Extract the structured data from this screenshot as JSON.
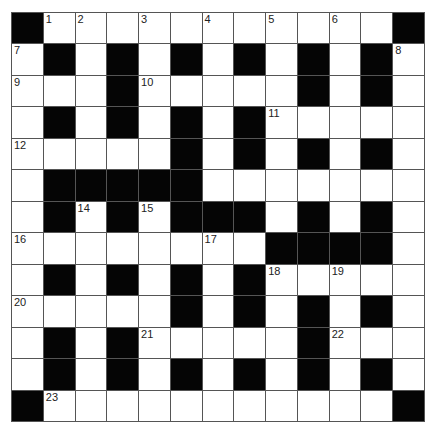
{
  "puzzle": {
    "rows": 13,
    "cols": 13,
    "layout": [
      "#...........#",
      ".#.#.#.#.#.#.",
      "...#.....#.#.",
      ".#.#.#.#.....",
      ".....#.#.#.#.",
      ".#####.......",
      ".#.#.###.#.#.",
      "........####.",
      ".#.#.#.#.....",
      ".....#.#.#.#.",
      ".#.#.....#...",
      ".#.#.#.#.#.#.",
      "#...........#"
    ],
    "numbers": [
      {
        "r": 0,
        "c": 1,
        "n": "1"
      },
      {
        "r": 0,
        "c": 2,
        "n": "2"
      },
      {
        "r": 0,
        "c": 4,
        "n": "3"
      },
      {
        "r": 0,
        "c": 6,
        "n": "4"
      },
      {
        "r": 0,
        "c": 8,
        "n": "5"
      },
      {
        "r": 0,
        "c": 10,
        "n": "6"
      },
      {
        "r": 1,
        "c": 0,
        "n": "7"
      },
      {
        "r": 1,
        "c": 12,
        "n": "8"
      },
      {
        "r": 2,
        "c": 0,
        "n": "9"
      },
      {
        "r": 2,
        "c": 4,
        "n": "10"
      },
      {
        "r": 3,
        "c": 8,
        "n": "11"
      },
      {
        "r": 4,
        "c": 0,
        "n": "12"
      },
      {
        "r": 5,
        "c": 5,
        "n": "13"
      },
      {
        "r": 6,
        "c": 2,
        "n": "14"
      },
      {
        "r": 6,
        "c": 4,
        "n": "15"
      },
      {
        "r": 7,
        "c": 0,
        "n": "16"
      },
      {
        "r": 7,
        "c": 6,
        "n": "17"
      },
      {
        "r": 8,
        "c": 8,
        "n": "18"
      },
      {
        "r": 8,
        "c": 10,
        "n": "19"
      },
      {
        "r": 9,
        "c": 0,
        "n": "20"
      },
      {
        "r": 10,
        "c": 4,
        "n": "21"
      },
      {
        "r": 10,
        "c": 10,
        "n": "22"
      },
      {
        "r": 12,
        "c": 1,
        "n": "23"
      }
    ]
  },
  "colors": {
    "block": "#050505",
    "cell": "#ffffff",
    "gridline": "#555555"
  }
}
